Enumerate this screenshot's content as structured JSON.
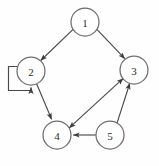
{
  "figure": {
    "kind": "directed-graph-diagram",
    "width": 159,
    "height": 166,
    "background_color": "#fefefe",
    "node_fill_color": "#ffffff",
    "node_stroke_color": "#6e6e6e",
    "edge_color": "#4a4a4a",
    "label_color": "#2b2b2b",
    "node_radius": 14
  },
  "nodes": [
    {
      "id": "1",
      "label": "1",
      "cx": 85,
      "cy": 22
    },
    {
      "id": "2",
      "label": "2",
      "cx": 31,
      "cy": 71
    },
    {
      "id": "3",
      "label": "3",
      "cx": 134,
      "cy": 70
    },
    {
      "id": "4",
      "label": "4",
      "cx": 57,
      "cy": 135
    },
    {
      "id": "5",
      "label": "5",
      "cx": 110,
      "cy": 135
    }
  ],
  "edges": [
    {
      "id": "e1",
      "from": "1",
      "to": "2",
      "kind": "straight",
      "arrow": "target"
    },
    {
      "id": "e2",
      "from": "1",
      "to": "3",
      "kind": "straight",
      "arrow": "target"
    },
    {
      "id": "e3",
      "from": "2",
      "to": "2",
      "kind": "self-loop",
      "arrow": "target"
    },
    {
      "id": "e4",
      "from": "2",
      "to": "4",
      "kind": "straight",
      "arrow": "target"
    },
    {
      "id": "e5",
      "from": "4",
      "to": "3",
      "kind": "straight",
      "arrow": "both"
    },
    {
      "id": "e6",
      "from": "5",
      "to": "3",
      "kind": "straight",
      "arrow": "target"
    },
    {
      "id": "e7",
      "from": "5",
      "to": "4",
      "kind": "straight",
      "arrow": "target"
    }
  ]
}
